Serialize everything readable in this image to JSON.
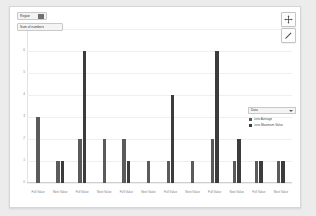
{
  "controls": {
    "filter_pill_label": "Region",
    "marks_pill_label": "Sum of numbers"
  },
  "tools": {
    "pan_icon": "move-cross-icon",
    "edit_icon": "pencil-icon"
  },
  "legend": {
    "title": "Data",
    "caret_icon": "chevron-down-icon",
    "entries": [
      {
        "label": "Less Average",
        "color": "#5b5b5b"
      },
      {
        "label": "Less Maximum Value",
        "color": "#3c3c3c"
      }
    ]
  },
  "chart_data": {
    "type": "bar",
    "title": "",
    "xlabel": "",
    "ylabel": "",
    "ylim": [
      0,
      7
    ],
    "grid": true,
    "legend_position": "right",
    "yticks": [
      "7",
      "6",
      "5",
      "4",
      "3",
      "2",
      "1",
      "0"
    ],
    "categories": [
      "Full Value",
      "Next Value",
      "Full Value",
      "Next Value",
      "Full Value",
      "Next Value",
      "Full Value",
      "Next Value",
      "Full Value",
      "Next Value",
      "Full Value",
      "Next Value"
    ],
    "series": [
      {
        "name": "Less Average",
        "color": "#5b5b5b",
        "values": [
          3,
          1,
          2,
          2,
          2,
          1,
          1,
          1,
          2,
          1,
          1,
          1
        ]
      },
      {
        "name": "Less Maximum Value",
        "color": "#3c3c3c",
        "values": [
          0,
          1,
          6,
          0,
          1,
          0,
          4,
          0,
          6,
          2,
          1,
          1
        ]
      }
    ]
  }
}
